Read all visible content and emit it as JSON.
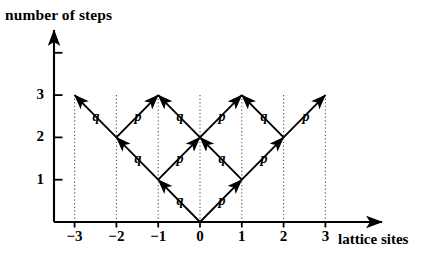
{
  "figure": {
    "type": "diagram",
    "kind": "random-walk-lattice-tree",
    "axes": {
      "y_axis_title": "number of steps",
      "x_axis_title": "lattice sites",
      "x_ticks": [
        "−3",
        "−2",
        "−1",
        "0",
        "1",
        "2",
        "3"
      ],
      "x_tick_values": [
        -3,
        -2,
        -1,
        0,
        1,
        2,
        3
      ],
      "y_ticks": [
        "1",
        "2",
        "3"
      ],
      "y_tick_values": [
        1,
        2,
        3
      ],
      "origin_px": [
        200,
        222
      ],
      "x_spacing_px": 41.8,
      "y_spacing_px": 42.3,
      "x_axis_arrow_end_px": [
        382,
        222
      ],
      "y_axis_arrow_end_px": [
        54,
        30
      ],
      "extra_y_tick_value": 4
    },
    "grid": {
      "dotted_vertical_sites": [
        -3,
        -2,
        -1,
        0,
        1,
        2,
        3
      ],
      "dotted_top_level": 3,
      "dotted_bottom_level": 0
    },
    "colors": {
      "ink": "#000000",
      "background": "#ffffff",
      "dotted": "#555555"
    },
    "arrows": [
      {
        "from": [
          0,
          0
        ],
        "to": [
          -1,
          1
        ],
        "label": "q"
      },
      {
        "from": [
          0,
          0
        ],
        "to": [
          1,
          1
        ],
        "label": "p"
      },
      {
        "from": [
          -1,
          1
        ],
        "to": [
          -2,
          2
        ],
        "label": "q"
      },
      {
        "from": [
          -1,
          1
        ],
        "to": [
          0,
          2
        ],
        "label": "p"
      },
      {
        "from": [
          1,
          1
        ],
        "to": [
          0,
          2
        ],
        "label": "q"
      },
      {
        "from": [
          1,
          1
        ],
        "to": [
          2,
          2
        ],
        "label": "p"
      },
      {
        "from": [
          -2,
          2
        ],
        "to": [
          -3,
          3
        ],
        "label": "q"
      },
      {
        "from": [
          -2,
          2
        ],
        "to": [
          -1,
          3
        ],
        "label": "p"
      },
      {
        "from": [
          0,
          2
        ],
        "to": [
          -1,
          3
        ],
        "label": "q"
      },
      {
        "from": [
          0,
          2
        ],
        "to": [
          1,
          3
        ],
        "label": "p"
      },
      {
        "from": [
          2,
          2
        ],
        "to": [
          1,
          3
        ],
        "label": "q"
      },
      {
        "from": [
          2,
          2
        ],
        "to": [
          3,
          3
        ],
        "label": "p"
      }
    ],
    "labels": [
      {
        "text": "q",
        "px": [
          180,
          202
        ]
      },
      {
        "text": "p",
        "px": [
          222,
          202
        ]
      },
      {
        "text": "q",
        "px": [
          138,
          160
        ]
      },
      {
        "text": "p",
        "px": [
          180,
          160
        ]
      },
      {
        "text": "q",
        "px": [
          222,
          160
        ]
      },
      {
        "text": "p",
        "px": [
          264,
          160
        ]
      },
      {
        "text": "q",
        "px": [
          96,
          118
        ]
      },
      {
        "text": "p",
        "px": [
          138,
          118
        ]
      },
      {
        "text": "q",
        "px": [
          180,
          118
        ]
      },
      {
        "text": "p",
        "px": [
          222,
          118
        ]
      },
      {
        "text": "q",
        "px": [
          264,
          118
        ]
      },
      {
        "text": "p",
        "px": [
          306,
          118
        ]
      }
    ]
  }
}
